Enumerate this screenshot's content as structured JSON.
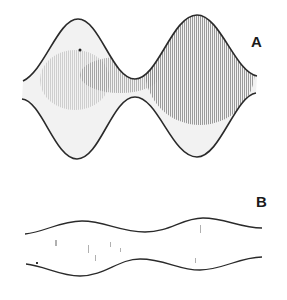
{
  "figure": {
    "panels": [
      {
        "label": "A",
        "description": "Large-amplitude sinusoidal envelope with dense stippled fill"
      },
      {
        "label": "B",
        "description": "Small-amplitude sinusoidal envelope with sparse stippled fill"
      }
    ]
  },
  "colors": {
    "background": "#ffffff",
    "line": "#2a2a2a",
    "stipple": "#8a8a8a"
  }
}
